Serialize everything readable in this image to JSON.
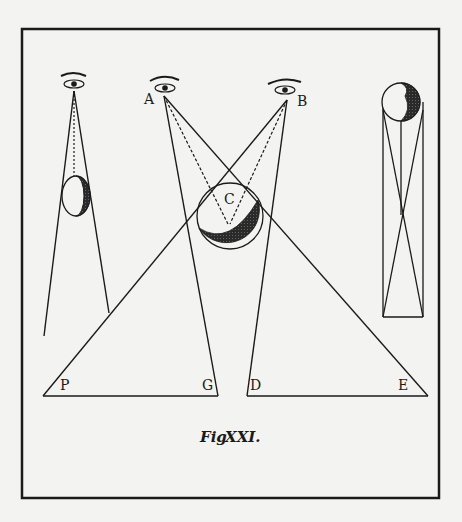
{
  "figure": {
    "caption": "Fig. XXI.",
    "caption_fig": "Fig",
    "caption_num": "XXI."
  },
  "labels": {
    "A": "A",
    "B": "B",
    "C": "C",
    "P": "P",
    "G": "G",
    "D": "D",
    "E": "E"
  },
  "elements": {
    "left_group": "single eye viewing crescent moon",
    "center_group": "two eyes A and B viewing sphere C projected to base P-G-D-E",
    "right_group": "sphere above crossed-line rectangle"
  },
  "colors": {
    "paper": "#f3f3f1",
    "ink": "#1a1a1a"
  }
}
